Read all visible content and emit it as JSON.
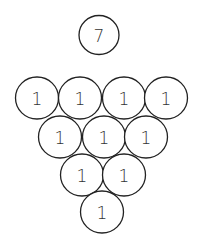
{
  "diagram": {
    "title_ball": {
      "label": "7"
    },
    "rows": [
      {
        "balls": [
          {
            "label": "1"
          },
          {
            "label": "1"
          },
          {
            "label": "1"
          },
          {
            "label": "1"
          }
        ]
      },
      {
        "balls": [
          {
            "label": "1"
          },
          {
            "label": "1"
          },
          {
            "label": "1"
          }
        ]
      },
      {
        "balls": [
          {
            "label": "1"
          },
          {
            "label": "1"
          }
        ]
      },
      {
        "balls": [
          {
            "label": "1"
          }
        ]
      }
    ],
    "stroke_color": "#222222",
    "background_color": "#ffffff"
  }
}
